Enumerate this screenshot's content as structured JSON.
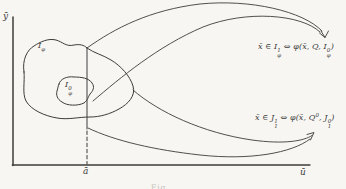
{
  "figure": {
    "background": "#f7f6f2",
    "ink": "#3c3c3c",
    "axis": {
      "y_label": "ȳ",
      "x_label": "ū",
      "marker_label": "ā"
    },
    "sets": {
      "outer": {
        "base": "I",
        "sub": "φ"
      },
      "inner": {
        "base": "I",
        "sup": "0",
        "sub": "φ"
      }
    },
    "formulas": {
      "top": {
        "p1": "x̄ ∈ I",
        "sup1": "1",
        "sub1": "φ",
        "p2": " ⇔ φ(x̄, Q, I",
        "sup2": "0",
        "sub2": "φ",
        "p3": ")"
      },
      "bottom": {
        "p1": "x̄ ∈ J",
        "sup1": "1",
        "sub1": "1",
        "p2": " ⇔ φ(x̄, Q",
        "supq": "0",
        "p3": ", J",
        "sup2": "0",
        "sub2": "1",
        "p4": ")"
      }
    },
    "caption_fragment": "Fig."
  }
}
